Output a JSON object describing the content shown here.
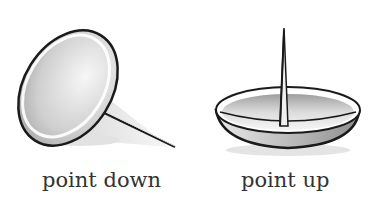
{
  "figures": [
    {
      "id": "tack-point-down",
      "caption": "point down"
    },
    {
      "id": "tack-point-up",
      "caption": "point up"
    }
  ],
  "colors": {
    "outline": "#1a1a1a",
    "fill_light": "#f4f4f4",
    "fill_dark": "#a8a8a8",
    "shadow": "#d9d9d9",
    "caption": "#333333"
  }
}
